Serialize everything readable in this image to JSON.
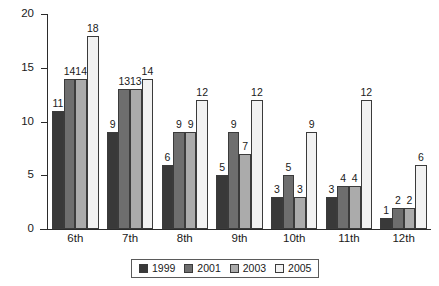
{
  "chart_data": {
    "type": "bar",
    "title": "",
    "subtitle": "",
    "xlabel": "",
    "ylabel": "",
    "categories": [
      "6th",
      "7th",
      "8th",
      "9th",
      "10th",
      "11th",
      "12th"
    ],
    "series": [
      {
        "name": "1999",
        "color": "#393939",
        "values": [
          11,
          9,
          6,
          5,
          3,
          3,
          1
        ]
      },
      {
        "name": "2001",
        "color": "#6e6e6e",
        "values": [
          14,
          13,
          9,
          9,
          5,
          4,
          2
        ]
      },
      {
        "name": "2003",
        "color": "#ababab",
        "values": [
          14,
          13,
          9,
          7,
          3,
          4,
          2
        ]
      },
      {
        "name": "2005",
        "color": "#f2f2f2",
        "values": [
          18,
          14,
          12,
          12,
          9,
          12,
          6
        ]
      }
    ],
    "ylim": [
      0,
      20
    ],
    "yticks": [
      0,
      5,
      10,
      15,
      20
    ],
    "ytick_labels": [
      "0",
      "5",
      "10",
      "15",
      "20"
    ],
    "grid": false,
    "data_labels": true,
    "legend_position": "bottom-center",
    "legend_entries": [
      "1999",
      "2001",
      "2003",
      "2005"
    ]
  }
}
